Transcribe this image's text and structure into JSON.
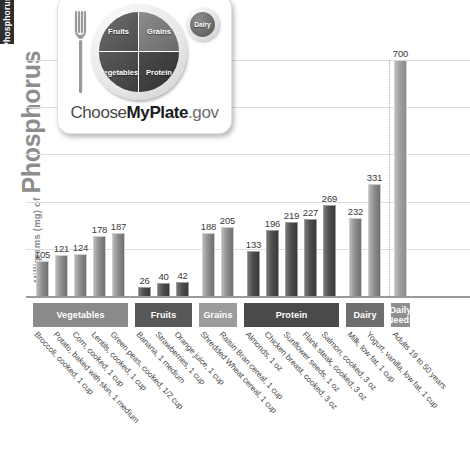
{
  "side_tab": {
    "label": "Phosphorus"
  },
  "axis": {
    "y_title_small": "Milligrams (mg) of",
    "y_title_big": "Phosphorus"
  },
  "myplate": {
    "alt": "ChooseMyPlate.gov",
    "quadrants": {
      "fruits": "Fruits",
      "grains": "Grains",
      "vegetables": "Vegetables",
      "protein": "Protein",
      "dairy": "Dairy"
    },
    "logo_prefix": "Choose",
    "logo_bold": "MyPlate",
    "logo_suffix": ".gov"
  },
  "chart_data": {
    "type": "bar",
    "xlabel": "",
    "ylabel": "Milligrams (mg) of Phosphorus",
    "ylim": [
      0,
      700
    ],
    "grid": true,
    "legend": "none",
    "categories": [
      "Broccoli, cooked, 1 cup",
      "Potato, baked with skin, 1 medium",
      "Corn, cooked, 1 cup",
      "Lentils, cooked, 1 cup",
      "Green peas, cooked, 1/2 cup",
      "Banana, 1 medium",
      "Strawberries, 1 cup",
      "Orange juice, 1 cup",
      "Shredded Wheat cereal, 1 cup",
      "Raisin Bran cereal, 1 cup",
      "Almonds, 1 oz",
      "Chicken breast, cooked, 3 oz",
      "Sunflower seeds, 1 oz",
      "Flank steak, cooked, 3 oz",
      "Salmon, cooked, 3 oz",
      "Milk, low fat, 1 cup",
      "Yogurt, vanilla, low fat, 1 cup",
      "Adults 19 to 50 years"
    ],
    "values": [
      105,
      121,
      124,
      178,
      187,
      26,
      40,
      42,
      188,
      205,
      133,
      196,
      219,
      227,
      269,
      232,
      331,
      700
    ],
    "groups": [
      {
        "label": "Vegetables",
        "start": 0,
        "count": 5,
        "color": "#8a8a8a",
        "tone": "mid"
      },
      {
        "label": "Fruits",
        "start": 5,
        "count": 3,
        "color": "#575757",
        "tone": "dark"
      },
      {
        "label": "Grains",
        "start": 8,
        "count": 2,
        "color": "#9c9c9c",
        "tone": "mid"
      },
      {
        "label": "Protein",
        "start": 10,
        "count": 5,
        "color": "#4a4a4a",
        "tone": "dark"
      },
      {
        "label": "Dairy",
        "start": 15,
        "count": 2,
        "color": "#6e6e6e",
        "tone": "mid"
      },
      {
        "label": "Daily\nNeeds",
        "start": 17,
        "count": 1,
        "color": "#8f8f8f",
        "tone": "needs"
      }
    ],
    "gridline_values": [
      140,
      280,
      420,
      560,
      700
    ],
    "daily_needs_value": 700,
    "daily_needs_label": "Daily Needs"
  }
}
